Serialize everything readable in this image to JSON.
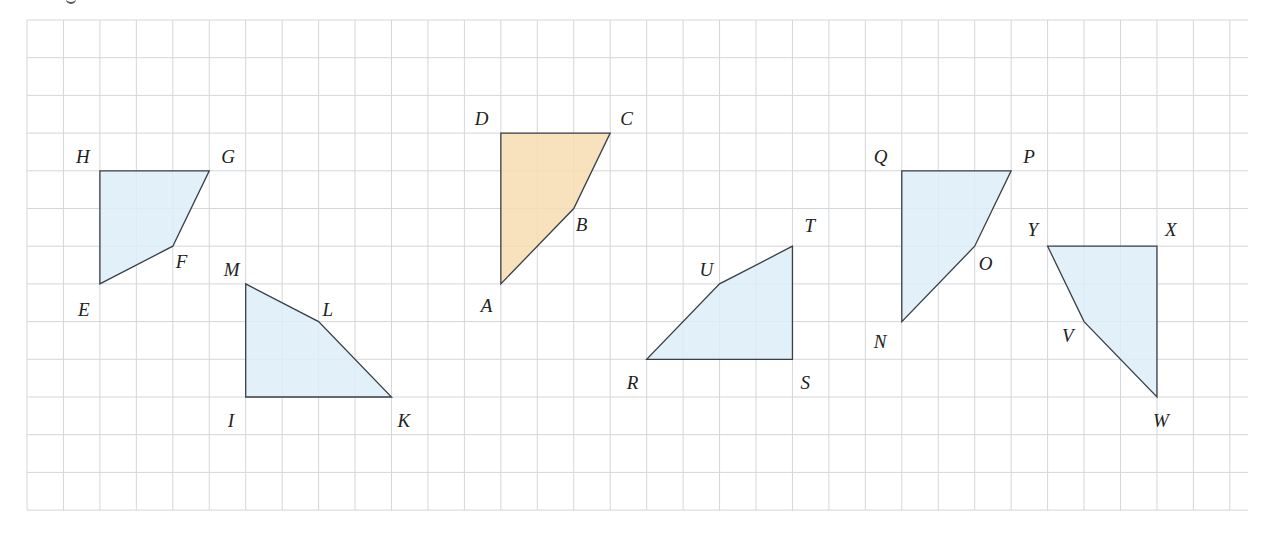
{
  "figure": {
    "grid": {
      "origin_x": 27,
      "origin_y": 20,
      "cell_w": 36.45,
      "cell_h": 37.7,
      "cols": 33.5,
      "rows": 13,
      "line_color": "#d4d6d9"
    },
    "colors": {
      "blue_fill": "#dcedf8",
      "orange_fill": "#f6ddb2",
      "stroke": "#3a3f44"
    },
    "shapes": [
      {
        "name": "EFGH",
        "fill": "blue",
        "vertices": [
          {
            "label": "H",
            "c": 2,
            "r": 4,
            "dx": -24,
            "dy": -8
          },
          {
            "label": "G",
            "c": 5,
            "r": 4,
            "dx": 12,
            "dy": -8
          },
          {
            "label": "F",
            "c": 4,
            "r": 6,
            "dx": 3,
            "dy": 22
          },
          {
            "label": "E",
            "c": 2,
            "r": 7,
            "dx": -22,
            "dy": 32
          }
        ]
      },
      {
        "name": "IKLM",
        "fill": "blue",
        "vertices": [
          {
            "label": "M",
            "c": 6,
            "r": 7,
            "dx": -22,
            "dy": -8
          },
          {
            "label": "L",
            "c": 8,
            "r": 8,
            "dx": 4,
            "dy": -6
          },
          {
            "label": "K",
            "c": 10,
            "r": 10,
            "dx": 6,
            "dy": 30
          },
          {
            "label": "I",
            "c": 6,
            "r": 10,
            "dx": -18,
            "dy": 30
          }
        ]
      },
      {
        "name": "ABCD",
        "fill": "orange",
        "vertices": [
          {
            "label": "D",
            "c": 13,
            "r": 3,
            "dx": -26,
            "dy": -8
          },
          {
            "label": "C",
            "c": 16,
            "r": 3,
            "dx": 10,
            "dy": -8
          },
          {
            "label": "B",
            "c": 15,
            "r": 5,
            "dx": 2,
            "dy": 22
          },
          {
            "label": "A",
            "c": 13,
            "r": 7,
            "dx": -20,
            "dy": 28
          }
        ]
      },
      {
        "name": "RSTU",
        "fill": "blue",
        "vertices": [
          {
            "label": "T",
            "c": 21,
            "r": 6,
            "dx": 12,
            "dy": -14
          },
          {
            "label": "U",
            "c": 19,
            "r": 7,
            "dx": -20,
            "dy": -8
          },
          {
            "label": "R",
            "c": 17,
            "r": 9,
            "dx": -20,
            "dy": 30
          },
          {
            "label": "S",
            "c": 21,
            "r": 9,
            "dx": 8,
            "dy": 30
          }
        ]
      },
      {
        "name": "NOPQ",
        "fill": "blue",
        "vertices": [
          {
            "label": "Q",
            "c": 24,
            "r": 4,
            "dx": -28,
            "dy": -8
          },
          {
            "label": "P",
            "c": 27,
            "r": 4,
            "dx": 12,
            "dy": -8
          },
          {
            "label": "O",
            "c": 26,
            "r": 6,
            "dx": 4,
            "dy": 24
          },
          {
            "label": "N",
            "c": 24,
            "r": 8,
            "dx": -28,
            "dy": 26
          }
        ]
      },
      {
        "name": "VWXY",
        "fill": "blue",
        "vertices": [
          {
            "label": "Y",
            "c": 28,
            "r": 6,
            "dx": -20,
            "dy": -10
          },
          {
            "label": "X",
            "c": 31,
            "r": 6,
            "dx": 8,
            "dy": -10
          },
          {
            "label": "W",
            "c": 31,
            "r": 10,
            "dx": -4,
            "dy": 30
          },
          {
            "label": "V",
            "c": 29,
            "r": 8,
            "dx": -22,
            "dy": 20
          }
        ]
      }
    ]
  }
}
